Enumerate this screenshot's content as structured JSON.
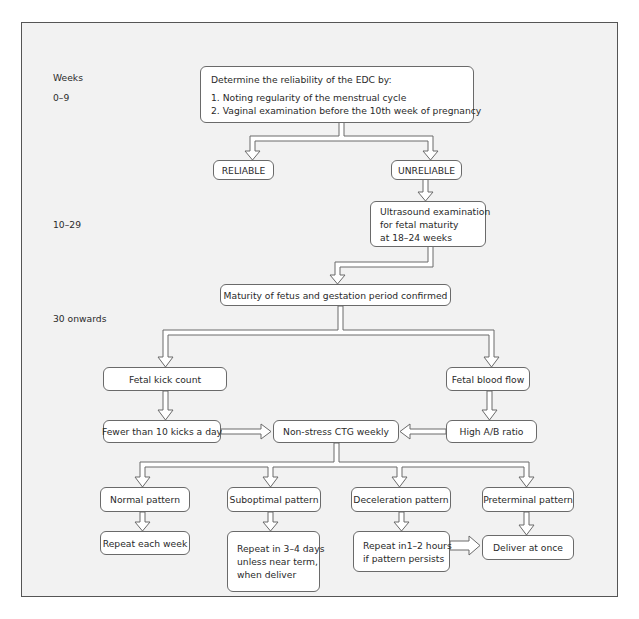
{
  "week_labels": {
    "header": "Weeks",
    "range_1": "0–9",
    "range_2": "10–29",
    "range_3": "30 onwards"
  },
  "nodes": {
    "edc": {
      "heading": "Determine the reliability of the EDC by:",
      "items": [
        "1. Noting regularity of the menstrual cycle",
        "2. Vaginal examination before the 10th week of pregnancy"
      ]
    },
    "reliable": "RELIABLE",
    "unreliable": "UNRELIABLE",
    "ultrasound": {
      "lines": [
        "Ultrasound examination",
        "for fetal maturity",
        "at 18–24 weeks"
      ]
    },
    "maturity_confirmed": "Maturity of fetus and gestation period confirmed",
    "kick_count": "Fetal kick count",
    "blood_flow": "Fetal blood flow",
    "fewer_kicks": "Fewer than 10 kicks a day",
    "ctg_weekly": "Non-stress CTG weekly",
    "high_ab_ratio": "High A/B ratio",
    "normal_pattern": "Normal pattern",
    "suboptimal_pattern": "Suboptimal pattern",
    "deceleration_pattern": "Deceleration pattern",
    "preterminal_pattern": "Preterminal pattern",
    "repeat_each_week": "Repeat each week",
    "repeat_3_4_days": {
      "lines": [
        "Repeat in 3–4 days",
        "unless near term,",
        "when deliver"
      ]
    },
    "repeat_1_2_hours": {
      "lines": [
        "Repeat in1–2 hours",
        "if pattern persists"
      ]
    },
    "deliver_at_once": "Deliver at once"
  },
  "edges": [
    {
      "from": "edc",
      "to": "reliable"
    },
    {
      "from": "edc",
      "to": "unreliable"
    },
    {
      "from": "unreliable",
      "to": "ultrasound"
    },
    {
      "from": "ultrasound",
      "to": "maturity_confirmed"
    },
    {
      "from": "maturity_confirmed",
      "to": "kick_count"
    },
    {
      "from": "maturity_confirmed",
      "to": "blood_flow"
    },
    {
      "from": "kick_count",
      "to": "fewer_kicks"
    },
    {
      "from": "blood_flow",
      "to": "high_ab_ratio"
    },
    {
      "from": "fewer_kicks",
      "to": "ctg_weekly"
    },
    {
      "from": "high_ab_ratio",
      "to": "ctg_weekly"
    },
    {
      "from": "ctg_weekly",
      "to": "normal_pattern"
    },
    {
      "from": "ctg_weekly",
      "to": "suboptimal_pattern"
    },
    {
      "from": "ctg_weekly",
      "to": "deceleration_pattern"
    },
    {
      "from": "ctg_weekly",
      "to": "preterminal_pattern"
    },
    {
      "from": "normal_pattern",
      "to": "repeat_each_week"
    },
    {
      "from": "suboptimal_pattern",
      "to": "repeat_3_4_days"
    },
    {
      "from": "deceleration_pattern",
      "to": "repeat_1_2_hours"
    },
    {
      "from": "preterminal_pattern",
      "to": "deliver_at_once"
    },
    {
      "from": "repeat_1_2_hours",
      "to": "deliver_at_once"
    }
  ],
  "colors": {
    "frame_background": "#f2f2f2",
    "box_background": "#ffffff",
    "line": "#6a6a6a"
  }
}
